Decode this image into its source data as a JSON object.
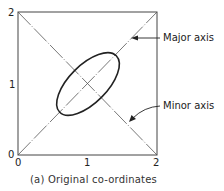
{
  "figure": {
    "caption": "(a) Original co-ordinates",
    "axes": {
      "x_ticks": [
        "0",
        "1",
        "2"
      ],
      "y_ticks": [
        "0",
        "1",
        "2"
      ],
      "range": [
        0,
        2
      ]
    },
    "annotations": {
      "major_axis": "Major axis",
      "minor_axis": "Minor axis"
    },
    "elements": {
      "box": "square frame from (0,0) to (2,2)",
      "major_axis_line": "diagonal from (0,0) to (2,2), dash-dot",
      "minor_axis_line": "diagonal from (0,2) to (2,0), dash-dot",
      "ellipse": "centered at (1,1), major axis along y=x"
    },
    "colors": {
      "stroke": "#222222",
      "axis_line": "#555555",
      "background": "#ffffff"
    }
  }
}
